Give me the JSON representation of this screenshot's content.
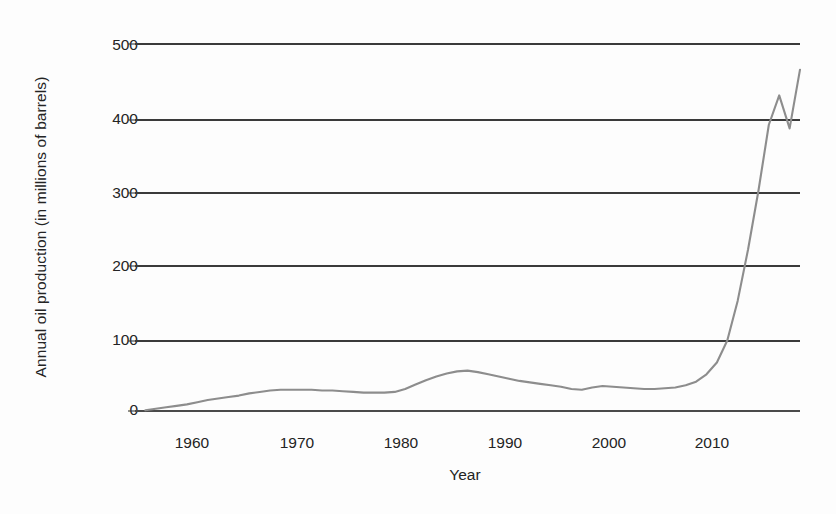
{
  "chart_data": {
    "type": "line",
    "title": "",
    "xlabel": "Year",
    "ylabel": "Annual oil production (in millions of barrels)",
    "xlim": [
      1953,
      2017
    ],
    "ylim": [
      0,
      500
    ],
    "xticks": [
      1960,
      1970,
      1980,
      1990,
      2000,
      2010
    ],
    "xtick_labels": [
      "1960",
      "1970",
      "1980",
      "1990",
      "2000",
      "2010"
    ],
    "yticks": [
      0,
      100,
      200,
      300,
      400,
      500
    ],
    "ytick_labels": [
      "0",
      "100",
      "200",
      "300",
      "400",
      "500"
    ],
    "grid": true,
    "grid_axis": "y",
    "legend": false,
    "legend_position": "none",
    "line_color": "#8d8d8d",
    "grid_color": "#3a3a3a",
    "background_color": "#fdfdfd",
    "series": [
      {
        "name": "Annual oil production",
        "x": [
          1954,
          1955,
          1956,
          1957,
          1958,
          1959,
          1960,
          1961,
          1962,
          1963,
          1964,
          1965,
          1966,
          1967,
          1968,
          1969,
          1970,
          1971,
          1972,
          1973,
          1974,
          1975,
          1976,
          1977,
          1978,
          1979,
          1980,
          1981,
          1982,
          1983,
          1984,
          1985,
          1986,
          1987,
          1988,
          1989,
          1990,
          1991,
          1992,
          1993,
          1994,
          1995,
          1996,
          1997,
          1998,
          1999,
          2000,
          2001,
          2002,
          2003,
          2004,
          2005,
          2006,
          2007,
          2008,
          2009,
          2010,
          2011,
          2012,
          2013,
          2014,
          2015,
          2016,
          2017
        ],
        "y": [
          1,
          3,
          5,
          7,
          9,
          12,
          15,
          17,
          19,
          21,
          24,
          26,
          28,
          29,
          29,
          29,
          29,
          28,
          28,
          27,
          26,
          25,
          25,
          25,
          26,
          30,
          36,
          42,
          47,
          51,
          54,
          55,
          53,
          50,
          47,
          44,
          41,
          39,
          37,
          35,
          33,
          30,
          29,
          32,
          34,
          33,
          32,
          31,
          30,
          30,
          31,
          32,
          35,
          40,
          50,
          66,
          96,
          150,
          220,
          300,
          390,
          430,
          385,
          465
        ]
      }
    ]
  }
}
